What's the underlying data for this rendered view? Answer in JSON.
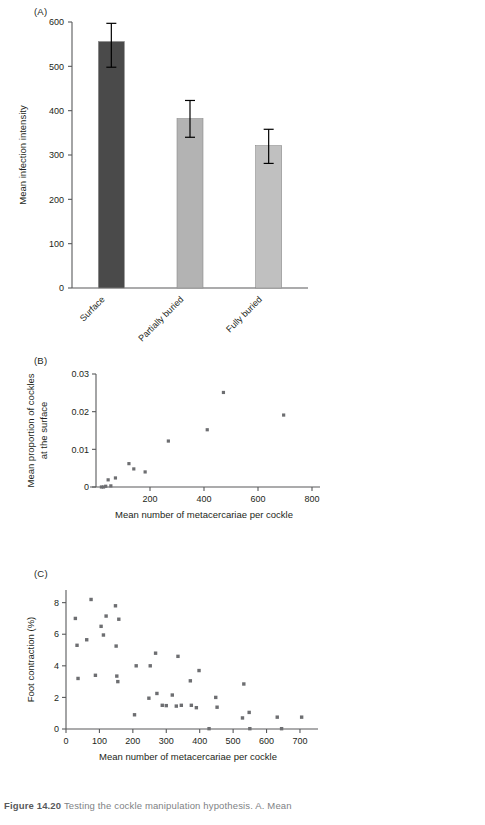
{
  "figure": {
    "caption_label": "Figure 14.20",
    "caption_text": "Testing the cockle manipulation hypothesis. A. Mean"
  },
  "panels": {
    "a": {
      "label": "(A)"
    },
    "b": {
      "label": "(B)"
    },
    "c": {
      "label": "(C)"
    }
  },
  "colors": {
    "bar_surface": "#4a4a4a",
    "bar_partially_buried": "#b3b3b3",
    "bar_fully_buried": "#c0c0c0",
    "point": "#6d6e71",
    "axis": "#58595b",
    "text": "#231f20",
    "caption": "#808285"
  },
  "chart_data": [
    {
      "type": "bar",
      "panel": "A",
      "title": "",
      "xlabel": "",
      "ylabel": "Mean infection intensity",
      "categories": [
        "Surface",
        "Partially buried",
        "Fully buried"
      ],
      "values": [
        556,
        382,
        321
      ],
      "errors_upper": [
        597,
        423,
        358
      ],
      "errors_lower": [
        498,
        340,
        281
      ],
      "ylim": [
        0,
        600
      ],
      "yticks": [
        0,
        100,
        200,
        300,
        400,
        500,
        600
      ],
      "ytick_labels": [
        "0",
        "100",
        "200",
        "300",
        "400",
        "500",
        "600"
      ],
      "grid": false,
      "legend": "none",
      "bar_colors": [
        "#4a4a4a",
        "#b3b3b3",
        "#c0c0c0"
      ]
    },
    {
      "type": "scatter",
      "panel": "B",
      "title": "",
      "xlabel": "Mean number of metacercariae per cockle",
      "ylabel": "Mean proportion of cockles at the surface",
      "ylabel_line1": "Mean proportion of cockles",
      "ylabel_line2": "at the surface",
      "xlim": [
        0,
        800
      ],
      "ylim": [
        0,
        0.03
      ],
      "xticks": [
        200,
        400,
        600,
        800
      ],
      "xtick_labels": [
        "200",
        "400",
        "600",
        "800"
      ],
      "yticks": [
        0,
        0.01,
        0.02,
        0.03
      ],
      "ytick_labels": [
        "0",
        "0.01",
        "0.02",
        "0.03"
      ],
      "grid": false,
      "legend": "none",
      "x": [
        20,
        28,
        36,
        45,
        55,
        72,
        122,
        140,
        182,
        268,
        412,
        472,
        695
      ],
      "y": [
        0.0,
        0.0,
        0.0002,
        0.0019,
        0.0003,
        0.0024,
        0.0062,
        0.0048,
        0.004,
        0.0122,
        0.0152,
        0.0251,
        0.0191
      ]
    },
    {
      "type": "scatter",
      "panel": "C",
      "title": "",
      "xlabel": "Mean number of metacercariae per cockle",
      "ylabel": "Foot contraction (%)",
      "xlim": [
        0,
        730
      ],
      "ylim": [
        0,
        8.8
      ],
      "xticks": [
        0,
        100,
        200,
        300,
        400,
        500,
        600,
        700
      ],
      "xtick_labels": [
        "0",
        "100",
        "200",
        "300",
        "400",
        "500",
        "600",
        "700"
      ],
      "yticks": [
        0,
        2,
        4,
        6,
        8
      ],
      "ytick_labels": [
        "0",
        "2",
        "4",
        "6",
        "8"
      ],
      "grid": false,
      "legend": "none",
      "x": [
        28,
        33,
        36,
        62,
        75,
        88,
        105,
        112,
        120,
        148,
        150,
        152,
        155,
        158,
        205,
        210,
        248,
        252,
        268,
        272,
        288,
        300,
        318,
        330,
        335,
        345,
        372,
        375,
        390,
        398,
        428,
        448,
        452,
        528,
        532,
        548,
        550,
        632,
        645,
        705
      ],
      "y": [
        7.0,
        5.3,
        3.2,
        5.65,
        8.2,
        3.4,
        6.5,
        5.95,
        7.15,
        7.8,
        5.25,
        3.35,
        3.0,
        6.95,
        0.9,
        4.0,
        1.95,
        4.0,
        4.8,
        2.25,
        1.5,
        1.48,
        2.15,
        1.45,
        4.6,
        1.5,
        3.05,
        1.5,
        1.35,
        3.7,
        0.02,
        2.0,
        1.38,
        0.7,
        2.85,
        1.05,
        0.02,
        0.75,
        0.02,
        0.75
      ]
    }
  ]
}
